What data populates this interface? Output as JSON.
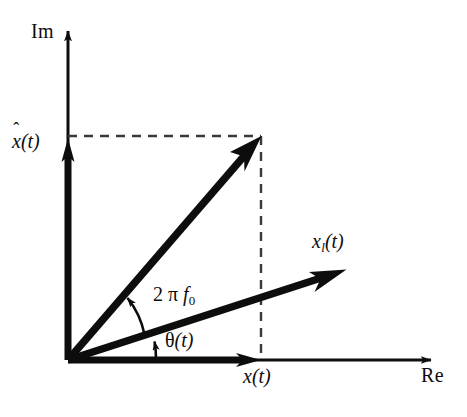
{
  "figure": {
    "kind": "complex-plane-phasor-diagram",
    "width": 467,
    "height": 417,
    "background": "#ffffff",
    "stroke_color": "#0d0d0d"
  },
  "axes": {
    "imaginary": {
      "label": "Im",
      "origin": {
        "x": 68,
        "y": 360
      },
      "tip": {
        "x": 68,
        "y": 24
      }
    },
    "real": {
      "label": "Re",
      "origin": {
        "x": 68,
        "y": 360
      },
      "tip": {
        "x": 441,
        "y": 360
      }
    }
  },
  "vectors": [
    {
      "name": "analytic-signal-vector",
      "label": "",
      "from": {
        "x": 68,
        "y": 360
      },
      "to": {
        "x": 261,
        "y": 137
      },
      "style": "bold-solid"
    },
    {
      "name": "lowpass-equivalent-vector",
      "label": "x_l(t)",
      "label_html": "x<sub>l</sub>(t)",
      "from": {
        "x": 68,
        "y": 360
      },
      "to": {
        "x": 346,
        "y": 270
      },
      "style": "bold-solid"
    },
    {
      "name": "imaginary-component-vector",
      "label": "x-hat(t)",
      "label_html": "x&#770;(t)",
      "from": {
        "x": 68,
        "y": 360
      },
      "to": {
        "x": 68,
        "y": 139
      },
      "style": "bold-solid"
    },
    {
      "name": "real-component-vector",
      "label": "x(t)",
      "from": {
        "x": 68,
        "y": 360
      },
      "to": {
        "x": 261,
        "y": 360
      },
      "style": "bold-solid"
    }
  ],
  "projection_lines": [
    {
      "name": "horizontal-projection",
      "from": {
        "x": 68,
        "y": 136
      },
      "to": {
        "x": 261,
        "y": 136
      },
      "style": "dashed"
    },
    {
      "name": "vertical-projection",
      "from": {
        "x": 261,
        "y": 136
      },
      "to": {
        "x": 261,
        "y": 360
      },
      "style": "dashed"
    }
  ],
  "angles": [
    {
      "name": "carrier-angle",
      "label": "2 π f0",
      "label_text": "2 π f",
      "label_sub": "0",
      "between": [
        "lowpass-equivalent-vector",
        "analytic-signal-vector"
      ],
      "arc_radius": 80,
      "arrow_at": "analytic-signal-vector"
    },
    {
      "name": "phase-angle",
      "label": "θ(t)",
      "label_text": "θ",
      "label_suffix": "(t)",
      "between": [
        "real-axis",
        "lowpass-equivalent-vector"
      ],
      "arc_radius": 112,
      "arrow_at": "lowpass-equivalent-vector"
    }
  ],
  "labels": {
    "im": "Im",
    "re": "Re",
    "x_hat_base": "x",
    "x_hat_accent": "ˆ",
    "x_hat_suffix": "(t)",
    "x_of_t": "x",
    "x_of_t_suffix": "(t)",
    "x_l_base": "x",
    "x_l_sub": "l",
    "x_l_suffix": "(t)",
    "two": "2",
    "pi": "π",
    "f": "f",
    "f_sub": "0",
    "theta": "θ",
    "theta_suffix": "(t)"
  }
}
